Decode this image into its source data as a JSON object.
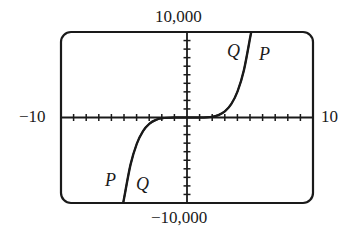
{
  "chart_data": {
    "type": "line",
    "title": "",
    "xlabel": "",
    "ylabel": "",
    "xlim": [
      -10,
      10
    ],
    "ylim": [
      -10000,
      10000
    ],
    "x_tick_step": 1,
    "y_tick_step": 1000,
    "grid": false,
    "legend": "none (curves labeled inline)",
    "axis_labels": {
      "x_min": "−10",
      "x_max": "10",
      "y_max": "10,000",
      "y_min": "−10,000"
    },
    "series": [
      {
        "name": "P",
        "x": [
          -5.08,
          -5,
          -4.5,
          -4,
          -3.5,
          -3,
          -2.5,
          -2,
          -1,
          0,
          1,
          2,
          2.5,
          3,
          3.5,
          4,
          4.5,
          5,
          5.08
        ],
        "y": [
          -10000,
          -9375,
          -5535,
          -3072,
          -1576,
          -729,
          -293,
          -96,
          -3,
          0,
          3,
          96,
          293,
          729,
          1576,
          3072,
          5535,
          9375,
          10000
        ]
      },
      {
        "name": "Q",
        "x": [
          -5.08,
          -5,
          -4.5,
          -4,
          -3.5,
          -3,
          -2.5,
          -2,
          -1,
          0,
          1,
          2,
          2.5,
          3,
          3.5,
          4,
          4.5,
          5,
          5.08
        ],
        "y": [
          -10000,
          -9375,
          -5535,
          -3072,
          -1576,
          -729,
          -293,
          -96,
          -3,
          0,
          3,
          96,
          293,
          729,
          1576,
          3072,
          5535,
          9375,
          10000
        ]
      }
    ],
    "annotations": [
      {
        "text": "Q",
        "x": 4.3,
        "y": 7600
      },
      {
        "text": "P",
        "x": 6.2,
        "y": 7300
      },
      {
        "text": "P",
        "x": -6.4,
        "y": -7600
      },
      {
        "text": "Q",
        "x": -4.0,
        "y": -8200
      }
    ]
  },
  "labels": {
    "y_max": "10,000",
    "y_min": "−10,000",
    "x_min": "−10",
    "x_max": "10",
    "q_upper": "Q",
    "p_upper": "P",
    "p_lower": "P",
    "q_lower": "Q"
  },
  "colors": {
    "ink": "#1a1a1a",
    "background": "#ffffff"
  }
}
